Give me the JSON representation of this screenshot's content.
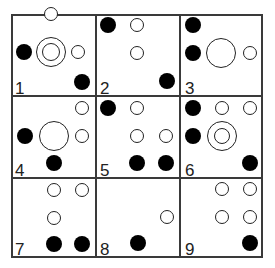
{
  "figure": {
    "type": "3x3 puzzle grid of circles",
    "cells": [
      {
        "label": "1",
        "shapes": [
          {
            "kind": "open",
            "x": 51,
            "y": 14,
            "r": 7
          },
          {
            "kind": "double",
            "x": 51,
            "y": 52,
            "r": 15,
            "inner_r": 9
          },
          {
            "kind": "filled",
            "x": 24,
            "y": 52,
            "r": 8
          },
          {
            "kind": "open",
            "x": 78,
            "y": 52,
            "r": 7
          },
          {
            "kind": "filled",
            "x": 82,
            "y": 82,
            "r": 8
          }
        ]
      },
      {
        "label": "2",
        "shapes": [
          {
            "kind": "filled",
            "x": 108,
            "y": 25,
            "r": 8
          },
          {
            "kind": "open",
            "x": 137,
            "y": 25,
            "r": 7
          },
          {
            "kind": "open",
            "x": 137,
            "y": 53,
            "r": 7
          },
          {
            "kind": "filled",
            "x": 167,
            "y": 81,
            "r": 8
          }
        ]
      },
      {
        "label": "3",
        "shapes": [
          {
            "kind": "filled",
            "x": 193,
            "y": 25,
            "r": 8
          },
          {
            "kind": "filled",
            "x": 193,
            "y": 53,
            "r": 8
          },
          {
            "kind": "open",
            "x": 221,
            "y": 53,
            "r": 15
          },
          {
            "kind": "open",
            "x": 250,
            "y": 53,
            "r": 7
          }
        ]
      },
      {
        "label": "4",
        "shapes": [
          {
            "kind": "open",
            "x": 82,
            "y": 108,
            "r": 7
          },
          {
            "kind": "open",
            "x": 54,
            "y": 136,
            "r": 15
          },
          {
            "kind": "filled",
            "x": 25,
            "y": 136,
            "r": 8
          },
          {
            "kind": "open",
            "x": 82,
            "y": 136,
            "r": 7
          },
          {
            "kind": "filled",
            "x": 54,
            "y": 163,
            "r": 8
          }
        ]
      },
      {
        "label": "5",
        "shapes": [
          {
            "kind": "filled",
            "x": 108,
            "y": 108,
            "r": 8
          },
          {
            "kind": "open",
            "x": 137,
            "y": 108,
            "r": 7
          },
          {
            "kind": "open",
            "x": 137,
            "y": 136,
            "r": 7
          },
          {
            "kind": "open",
            "x": 166,
            "y": 136,
            "r": 7
          },
          {
            "kind": "filled",
            "x": 137,
            "y": 163,
            "r": 8
          },
          {
            "kind": "filled",
            "x": 166,
            "y": 163,
            "r": 8
          }
        ]
      },
      {
        "label": "6",
        "shapes": [
          {
            "kind": "filled",
            "x": 193,
            "y": 108,
            "r": 8
          },
          {
            "kind": "open",
            "x": 222,
            "y": 108,
            "r": 7
          },
          {
            "kind": "open",
            "x": 250,
            "y": 108,
            "r": 7
          },
          {
            "kind": "filled",
            "x": 193,
            "y": 136,
            "r": 8
          },
          {
            "kind": "double",
            "x": 222,
            "y": 136,
            "r": 15,
            "inner_r": 8
          },
          {
            "kind": "filled",
            "x": 250,
            "y": 163,
            "r": 8
          }
        ]
      },
      {
        "label": "7",
        "shapes": [
          {
            "kind": "open",
            "x": 54,
            "y": 190,
            "r": 7
          },
          {
            "kind": "open",
            "x": 82,
            "y": 190,
            "r": 7
          },
          {
            "kind": "open",
            "x": 54,
            "y": 218,
            "r": 7
          },
          {
            "kind": "filled",
            "x": 54,
            "y": 244,
            "r": 8
          },
          {
            "kind": "filled",
            "x": 82,
            "y": 244,
            "r": 8
          }
        ]
      },
      {
        "label": "8",
        "shapes": [
          {
            "kind": "open",
            "x": 167,
            "y": 217,
            "r": 7
          },
          {
            "kind": "filled",
            "x": 138,
            "y": 243,
            "r": 8
          }
        ]
      },
      {
        "label": "9",
        "shapes": [
          {
            "kind": "open",
            "x": 222,
            "y": 189,
            "r": 7
          },
          {
            "kind": "open",
            "x": 250,
            "y": 189,
            "r": 7
          },
          {
            "kind": "open",
            "x": 222,
            "y": 217,
            "r": 7
          },
          {
            "kind": "open",
            "x": 250,
            "y": 217,
            "r": 7
          },
          {
            "kind": "filled",
            "x": 250,
            "y": 243,
            "r": 8
          }
        ]
      }
    ],
    "label_positions": [
      {
        "x": 15,
        "y": 80
      },
      {
        "x": 100,
        "y": 80
      },
      {
        "x": 185,
        "y": 80
      },
      {
        "x": 15,
        "y": 162
      },
      {
        "x": 100,
        "y": 162
      },
      {
        "x": 185,
        "y": 162
      },
      {
        "x": 15,
        "y": 241
      },
      {
        "x": 100,
        "y": 241
      },
      {
        "x": 185,
        "y": 241
      }
    ]
  }
}
